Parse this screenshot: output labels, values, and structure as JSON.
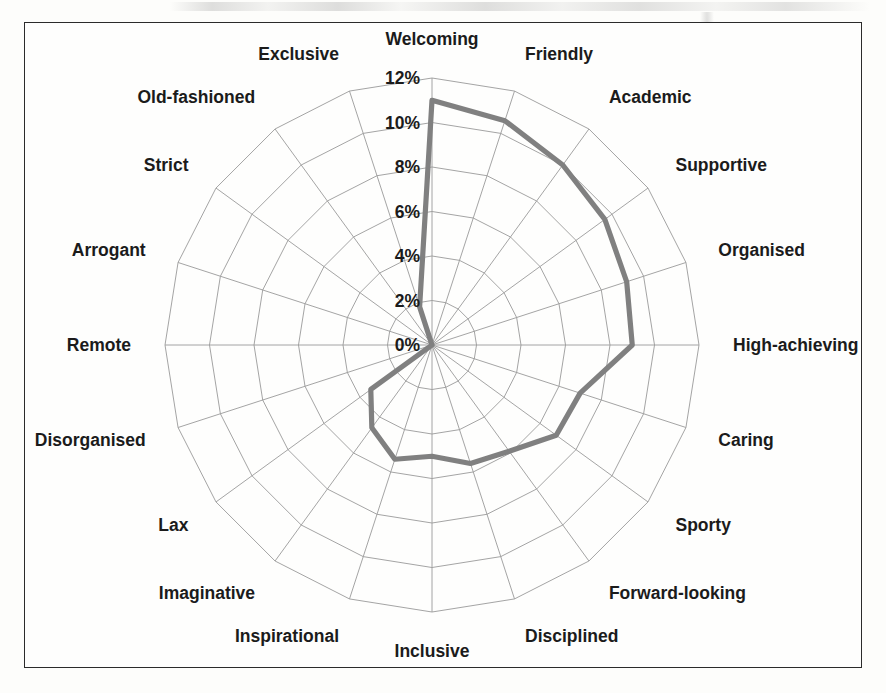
{
  "figure": {
    "frame_border_color": "#2b2b2b",
    "background_color": "#fefefd"
  },
  "chart_data": {
    "type": "radar",
    "title": "",
    "subtitle": "",
    "xlabel": "",
    "ylabel": "",
    "grid": true,
    "legend": "none",
    "series_color": "#808080",
    "grid_color": "#9a9a9a",
    "rlim": [
      0,
      12
    ],
    "r_tick_step": 2,
    "r_tick_labels": [
      "0%",
      "2%",
      "4%",
      "6%",
      "8%",
      "10%",
      "12%"
    ],
    "r_tick_values": [
      0,
      2,
      4,
      6,
      8,
      10,
      12
    ],
    "categories": [
      "Welcoming",
      "Friendly",
      "Academic",
      "Supportive",
      "Organised",
      "High-achieving",
      "Caring",
      "Sporty",
      "Forward-looking",
      "Disciplined",
      "Inclusive",
      "Inspirational",
      "Imaginative",
      "Lax",
      "Disorganised",
      "Remote",
      "Arrogant",
      "Strict",
      "Old-fashioned",
      "Exclusive"
    ],
    "series": [
      {
        "name": "",
        "values": [
          11.0,
          10.6,
          10.0,
          9.6,
          9.2,
          9.0,
          7.0,
          6.9,
          5.9,
          5.6,
          5.0,
          5.4,
          4.6,
          3.4,
          0.0,
          0.0,
          0.0,
          0.0,
          0.0,
          1.8
        ]
      }
    ]
  }
}
